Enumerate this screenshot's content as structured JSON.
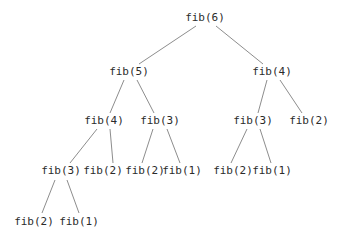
{
  "figure": {
    "background_color": "#ffffff",
    "edge_color": "#8d8d8d",
    "label_color": "#2b2b2b"
  },
  "chart_data": {
    "type": "diagram",
    "diagram_type": "tree",
    "title": "",
    "xlabel": "",
    "ylabel": "",
    "grid": false,
    "legend": null,
    "root": "n0",
    "depth": 5,
    "node_count": 15,
    "levels": [
      [
        "fib(6)"
      ],
      [
        "fib(5)",
        "fib(4)"
      ],
      [
        "fib(4)",
        "fib(3)",
        "fib(3)",
        "fib(2)"
      ],
      [
        "fib(3)",
        "fib(2)",
        "fib(2)",
        "fib(1)",
        "fib(2)",
        "fib(1)"
      ],
      [
        "fib(2)",
        "fib(1)"
      ]
    ],
    "nodes": [
      {
        "id": "n0",
        "label": "fib(6)",
        "arg": 6,
        "level": 0,
        "x": 205,
        "y": 21
      },
      {
        "id": "n1",
        "label": "fib(5)",
        "arg": 5,
        "level": 1,
        "x": 129,
        "y": 75
      },
      {
        "id": "n2",
        "label": "fib(4)",
        "arg": 4,
        "level": 1,
        "x": 272,
        "y": 75
      },
      {
        "id": "n3",
        "label": "fib(4)",
        "arg": 4,
        "level": 2,
        "x": 104,
        "y": 124
      },
      {
        "id": "n4",
        "label": "fib(3)",
        "arg": 3,
        "level": 2,
        "x": 160,
        "y": 124
      },
      {
        "id": "n5",
        "label": "fib(3)",
        "arg": 3,
        "level": 2,
        "x": 253,
        "y": 124
      },
      {
        "id": "n6",
        "label": "fib(2)",
        "arg": 2,
        "level": 2,
        "x": 309,
        "y": 124
      },
      {
        "id": "n7",
        "label": "fib(3)",
        "arg": 3,
        "level": 3,
        "x": 61,
        "y": 174
      },
      {
        "id": "n8",
        "label": "fib(2)",
        "arg": 2,
        "level": 3,
        "x": 103,
        "y": 174
      },
      {
        "id": "n9",
        "label": "fib(2)",
        "arg": 2,
        "level": 3,
        "x": 145,
        "y": 174
      },
      {
        "id": "n10",
        "label": "fib(1)",
        "arg": 1,
        "level": 3,
        "x": 182,
        "y": 174
      },
      {
        "id": "n11",
        "label": "fib(2)",
        "arg": 2,
        "level": 3,
        "x": 233,
        "y": 174
      },
      {
        "id": "n12",
        "label": "fib(1)",
        "arg": 1,
        "level": 3,
        "x": 272,
        "y": 174
      },
      {
        "id": "n13",
        "label": "fib(2)",
        "arg": 2,
        "level": 4,
        "x": 34,
        "y": 225
      },
      {
        "id": "n14",
        "label": "fib(1)",
        "arg": 1,
        "level": 4,
        "x": 79,
        "y": 225
      }
    ],
    "edges": [
      {
        "from": "n0",
        "to": "n1",
        "x1": 196,
        "y1": 26,
        "x2": 139,
        "y2": 64
      },
      {
        "from": "n0",
        "to": "n2",
        "x1": 216,
        "y1": 26,
        "x2": 263,
        "y2": 64
      },
      {
        "from": "n1",
        "to": "n3",
        "x1": 124,
        "y1": 80,
        "x2": 110,
        "y2": 113
      },
      {
        "from": "n1",
        "to": "n4",
        "x1": 137,
        "y1": 80,
        "x2": 154,
        "y2": 113
      },
      {
        "from": "n2",
        "to": "n5",
        "x1": 267,
        "y1": 80,
        "x2": 258,
        "y2": 113
      },
      {
        "from": "n2",
        "to": "n6",
        "x1": 280,
        "y1": 80,
        "x2": 302,
        "y2": 113
      },
      {
        "from": "n3",
        "to": "n7",
        "x1": 97,
        "y1": 129,
        "x2": 70,
        "y2": 163
      },
      {
        "from": "n3",
        "to": "n8",
        "x1": 110,
        "y1": 129,
        "x2": 113,
        "y2": 163
      },
      {
        "from": "n4",
        "to": "n9",
        "x1": 153,
        "y1": 129,
        "x2": 142,
        "y2": 163
      },
      {
        "from": "n4",
        "to": "n10",
        "x1": 167,
        "y1": 129,
        "x2": 180,
        "y2": 163
      },
      {
        "from": "n5",
        "to": "n11",
        "x1": 247,
        "y1": 129,
        "x2": 231,
        "y2": 163
      },
      {
        "from": "n5",
        "to": "n12",
        "x1": 260,
        "y1": 129,
        "x2": 271,
        "y2": 163
      },
      {
        "from": "n7",
        "to": "n13",
        "x1": 55,
        "y1": 180,
        "x2": 42,
        "y2": 213
      },
      {
        "from": "n7",
        "to": "n14",
        "x1": 67,
        "y1": 180,
        "x2": 79,
        "y2": 213
      }
    ]
  }
}
